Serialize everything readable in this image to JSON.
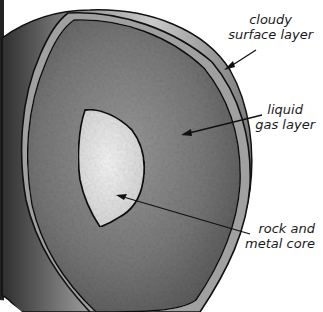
{
  "diagram": {
    "labels": {
      "cloudy_surface": {
        "line1": "cloudy",
        "line2": "surface layer"
      },
      "liquid_gas": {
        "line1": "liquid",
        "line2": "gas layer"
      },
      "core": {
        "line1": "rock and",
        "line2": "metal core"
      }
    },
    "layers": [
      {
        "name": "cloudy surface layer",
        "color": "#9a9a9a"
      },
      {
        "name": "liquid gas layer",
        "color": "#6e6e6e"
      },
      {
        "name": "rock and metal core",
        "color": "#e6e6e6"
      }
    ],
    "colors": {
      "outline": "#111111",
      "background": "#ffffff",
      "outer_shell_light": "#c8c8c8",
      "outer_shell_dark": "#3a3a3a"
    }
  }
}
